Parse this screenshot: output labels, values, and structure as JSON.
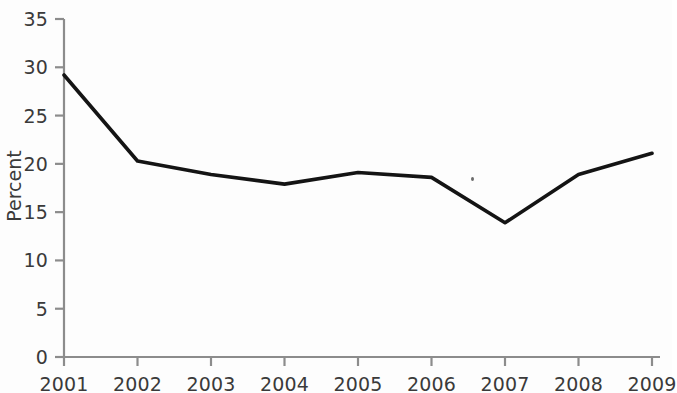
{
  "chart_data": {
    "type": "line",
    "title": "",
    "subtitle": "",
    "xlabel": "",
    "ylabel": "Percent",
    "x": [
      2001,
      2002,
      2003,
      2004,
      2005,
      2006,
      2007,
      2008,
      2009
    ],
    "categories": [
      "2001",
      "2002",
      "2003",
      "2004",
      "2005",
      "2006",
      "2007",
      "2008",
      "2009"
    ],
    "values": [
      29.2,
      20.3,
      18.9,
      17.9,
      19.1,
      18.6,
      13.9,
      18.9,
      21.1
    ],
    "series": [
      {
        "name": "Percent",
        "values": [
          29.2,
          20.3,
          18.9,
          17.9,
          19.1,
          18.6,
          13.9,
          18.9,
          21.1
        ]
      }
    ],
    "ylim": [
      0,
      35
    ],
    "yticks": [
      0,
      5,
      10,
      15,
      20,
      25,
      30,
      35
    ],
    "ytick_labels": [
      "0",
      "5",
      "10",
      "15",
      "20",
      "25",
      "30",
      "35"
    ],
    "xtick_labels": [
      "2001",
      "2002",
      "2003",
      "2004",
      "2005",
      "2006",
      "2007",
      "2008",
      "2009"
    ],
    "grid": false,
    "legend": false,
    "legend_position": "none",
    "line_color": "#141414",
    "axis_color": "#8c8c8c",
    "text_color": "#3a3a3a",
    "background_color": "#fdfdfd",
    "markers": false,
    "annotations": []
  },
  "axis": {
    "y_title": "Percent"
  }
}
